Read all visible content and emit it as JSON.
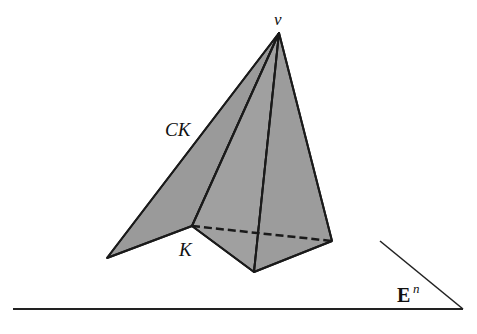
{
  "figure": {
    "labels": {
      "apex": "v",
      "cone": "CK",
      "base": "K",
      "space": "E",
      "space_superscript": "n"
    },
    "colors": {
      "fill": "#9a9a9a",
      "stroke": "#1a1a1a",
      "background": "#ffffff"
    },
    "vertices": {
      "apex": [
        279,
        33
      ],
      "left_tip": [
        107,
        258
      ],
      "k_vertex": [
        192,
        226
      ],
      "front_bottom": [
        254,
        272
      ],
      "right": [
        332,
        241
      ]
    },
    "plane": {
      "bottom_line": [
        [
          13,
          309
        ],
        [
          463,
          309
        ]
      ],
      "slant_line": [
        [
          380,
          241
        ],
        [
          463,
          309
        ]
      ]
    }
  }
}
